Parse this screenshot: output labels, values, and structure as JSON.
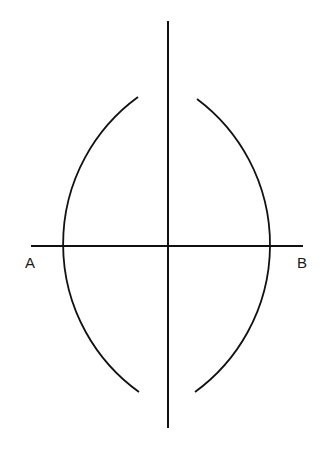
{
  "diagram": {
    "type": "geometric-construction",
    "labels": {
      "point_a": "A",
      "point_b": "B"
    },
    "caption": "",
    "stroke_color": "#111111",
    "geometry": {
      "segment_ab": {
        "x1": 31,
        "y1": 246,
        "x2": 303,
        "y2": 246
      },
      "bisector": {
        "x1": 168,
        "y1": 21,
        "x2": 168,
        "y2": 428
      },
      "intersection_top": {
        "x": 167,
        "y": 125
      },
      "intersection_bottom": {
        "x": 167,
        "y": 366
      },
      "arc_radius": 182
    }
  }
}
